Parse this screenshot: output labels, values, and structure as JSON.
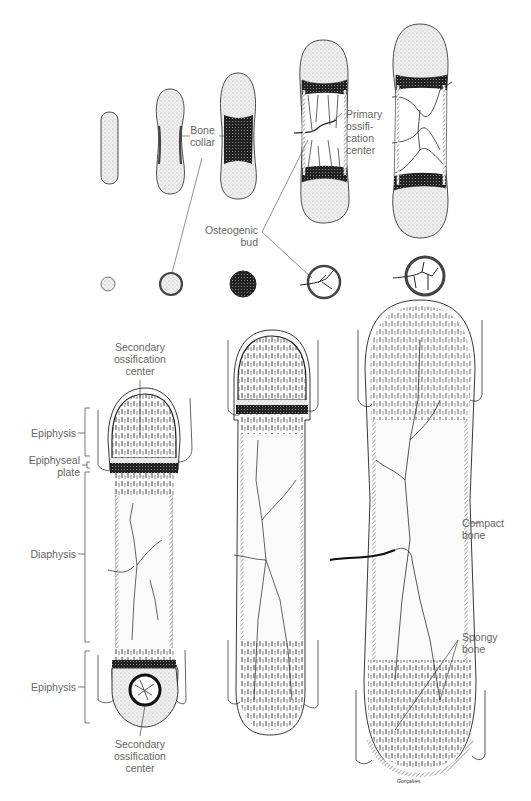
{
  "figure": {
    "top_row_stages": 5,
    "bottom_row_stages": 3
  },
  "labels": {
    "bone_collar": [
      "Bone",
      "collar"
    ],
    "primary_ossification_center": [
      "Primary",
      "ossifi-",
      "cation",
      "center"
    ],
    "osteogenic_bud": [
      "Osteogenic",
      "bud"
    ],
    "secondary_ossification_center_top": [
      "Secondary",
      "ossification",
      "center"
    ],
    "epiphysis_top": "Epiphysis",
    "epiphyseal_plate": [
      "Epiphyseal",
      "plate"
    ],
    "diaphysis": "Diaphysis",
    "epiphysis_bottom": "Epiphysis",
    "secondary_ossification_center_bottom": [
      "Secondary",
      "ossification",
      "center"
    ],
    "compact_bone": [
      "Compact",
      "bone"
    ],
    "spongy_bone": [
      "Spongy",
      "bone"
    ],
    "signature": "Gonçalves"
  },
  "colors": {
    "ink": "#1a1a1a",
    "cartilage_fill": "#e4e4e4",
    "bone_dark": "#2a2a2a",
    "label": "#666666",
    "background": "#ffffff"
  }
}
